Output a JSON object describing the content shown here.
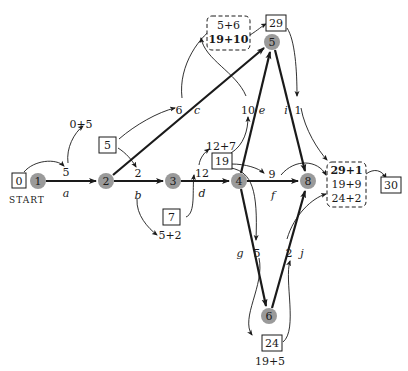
{
  "diagram": {
    "type": "critical-path-network",
    "start_label": "START",
    "nodes": [
      {
        "id": "1",
        "x": 38,
        "y": 181
      },
      {
        "id": "2",
        "x": 106,
        "y": 181
      },
      {
        "id": "3",
        "x": 173,
        "y": 181
      },
      {
        "id": "4",
        "x": 239,
        "y": 181
      },
      {
        "id": "5",
        "x": 272,
        "y": 42
      },
      {
        "id": "6",
        "x": 269,
        "y": 316
      },
      {
        "id": "8",
        "x": 308,
        "y": 181
      }
    ],
    "edges": [
      {
        "from": "1",
        "to": "2",
        "label": "a",
        "duration": "5"
      },
      {
        "from": "2",
        "to": "3",
        "label": "b",
        "duration": "2"
      },
      {
        "from": "2",
        "to": "5",
        "label": "c",
        "duration": "6"
      },
      {
        "from": "3",
        "to": "4",
        "label": "d",
        "duration": "12"
      },
      {
        "from": "4",
        "to": "5",
        "label": "e",
        "duration": "10"
      },
      {
        "from": "4",
        "to": "8",
        "label": "f",
        "duration": "9"
      },
      {
        "from": "4",
        "to": "6",
        "label": "g",
        "duration": "5"
      },
      {
        "from": "5",
        "to": "8",
        "label": "i",
        "duration": "1"
      },
      {
        "from": "6",
        "to": "8",
        "label": "j",
        "duration": "2"
      }
    ],
    "earliest_times": {
      "node1": "0",
      "node2": "5",
      "node3": "7",
      "node4": "19",
      "node5": "29",
      "node6": "24",
      "node8": "30"
    },
    "sums": {
      "s_0_5": "0+5",
      "s_5_2": "5+2",
      "s_12_7": "12+7",
      "s_19_5": "19+5",
      "node5_options": [
        "5+6",
        "19+10"
      ],
      "node8_options": [
        "29+1",
        "19+9",
        "24+2"
      ]
    }
  }
}
